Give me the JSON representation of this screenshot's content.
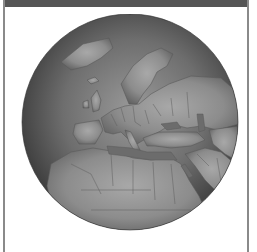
{
  "panel": {
    "header_text": "",
    "colors": {
      "header": "#555555",
      "border": "#8a8a8a",
      "background": "#ffffff"
    }
  },
  "globe": {
    "view": "orthographic",
    "center_region": "Europe / Mediterranean",
    "visible_regions": [
      "Greenland",
      "Scandinavia",
      "Europe",
      "Mediterranean Sea",
      "North Africa",
      "Middle East",
      "Arabian Peninsula",
      "Black Sea",
      "Caspian Sea"
    ],
    "colors": {
      "ocean_light": "#8e8e8e",
      "ocean_dark": "#3a3a3a",
      "land": "#9a9a9a",
      "land_dark": "#6a6a6a",
      "borders": "#5a5a5a"
    }
  }
}
